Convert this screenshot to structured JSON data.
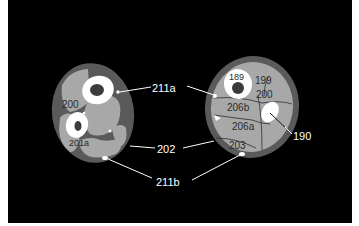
{
  "figure": {
    "background": "#000000",
    "colors": {
      "skin_fat": "#5a5a5a",
      "muscle": "#a8a8a8",
      "bone_cortex": "#ffffff",
      "marrow": "#3c3c3c",
      "leader_line": "#ffffff",
      "septum": "#2e2e2e"
    },
    "left_section": {
      "labels": {
        "l200": "200",
        "l201a": "201a"
      }
    },
    "right_section": {
      "labels": {
        "l189": "189",
        "l199": "199",
        "l200": "200",
        "l206b": "206b",
        "l206a": "206a",
        "l203": "203"
      }
    },
    "callouts": {
      "c211a": "211a",
      "c202": "202",
      "c211b": "211b",
      "c190": "190"
    }
  }
}
